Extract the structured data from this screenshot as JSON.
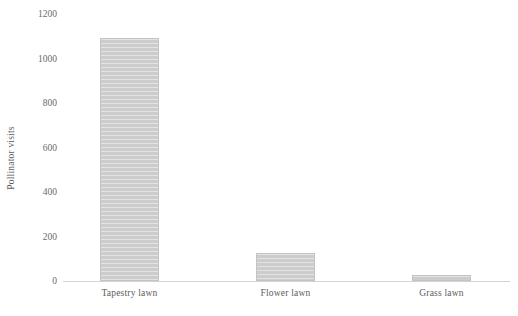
{
  "chart_data": {
    "type": "bar",
    "title": "",
    "subtitle": "",
    "xlabel": "",
    "ylabel": "Pollinator visits",
    "categories": [
      "Tapestry lawn",
      "Flower lawn",
      "Grass lawn"
    ],
    "values": [
      1092,
      126,
      27
    ],
    "series": [
      {
        "name": "Pollinator visits",
        "values": [
          1092,
          126,
          27
        ]
      }
    ],
    "ylim": [
      0,
      1200
    ],
    "ytick_labels": [
      "0",
      "200",
      "400",
      "600",
      "800",
      "1000",
      "1200"
    ],
    "ytick_values": [
      0,
      200,
      400,
      600,
      800,
      1000,
      1200
    ],
    "grid": false,
    "legend": false,
    "legend_position": "none",
    "annotations": [],
    "colors": {
      "bar_fill": "#cccccc",
      "bar_border": "#c3c3c3",
      "axis_line": "#d4d4d4",
      "tick_text": "#6a6a6a",
      "label_text": "#5d5d5d",
      "background": "#ffffff"
    }
  }
}
